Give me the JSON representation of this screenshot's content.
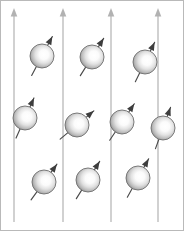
{
  "figure": {
    "width": 184,
    "height": 231,
    "background_color": "#ffffff",
    "border_color": "#b9b9b9"
  },
  "field_lines": {
    "icon_name": "up-arrow-icon",
    "color": "#b2b2b2",
    "stroke_width": 1.2,
    "direction": "up",
    "count": 4,
    "y_top": 8,
    "y_bottom": 222,
    "x_positions": [
      14,
      63,
      111,
      158
    ]
  },
  "spins": {
    "sphere_radius": 12,
    "sphere_edge_color": "#6e6e6e",
    "sphere_highlight_color": "#ffffff",
    "sphere_shade_color": "#8f8f8f",
    "arrow_color": "#3d3d3d",
    "arrow_length": 44,
    "items": [
      {
        "id": "spin-1",
        "label": "top-left",
        "cx": 42,
        "cy": 56,
        "angle_deg": -62
      },
      {
        "id": "spin-2",
        "label": "top-middle",
        "cx": 92,
        "cy": 57,
        "angle_deg": -58
      },
      {
        "id": "spin-3",
        "label": "top-right",
        "cx": 145,
        "cy": 62,
        "angle_deg": -64
      },
      {
        "id": "spin-4",
        "label": "middle-left",
        "cx": 25,
        "cy": 118,
        "angle_deg": -66
      },
      {
        "id": "spin-5",
        "label": "middle-center",
        "cx": 77,
        "cy": 125,
        "angle_deg": -40
      },
      {
        "id": "spin-6",
        "label": "middle-right",
        "cx": 122,
        "cy": 122,
        "angle_deg": -56
      },
      {
        "id": "spin-7",
        "label": "right-outer",
        "cx": 163,
        "cy": 128,
        "angle_deg": -70
      },
      {
        "id": "spin-8",
        "label": "bottom-left",
        "cx": 44,
        "cy": 182,
        "angle_deg": -54
      },
      {
        "id": "spin-9",
        "label": "bottom-middle",
        "cx": 88,
        "cy": 180,
        "angle_deg": -58
      },
      {
        "id": "spin-10",
        "label": "bottom-right",
        "cx": 138,
        "cy": 178,
        "angle_deg": -61
      }
    ]
  }
}
